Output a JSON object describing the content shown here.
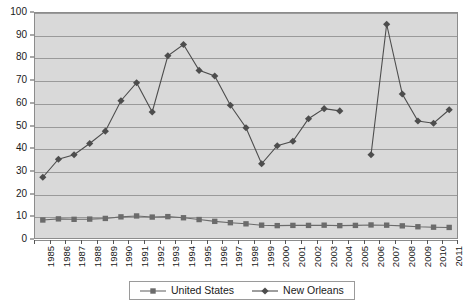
{
  "chart_data": {
    "type": "line",
    "title": "",
    "subtitle": "",
    "xlabel": "",
    "ylabel": "",
    "ylim": [
      0,
      100
    ],
    "yticks": [
      0,
      10,
      20,
      30,
      40,
      50,
      60,
      70,
      80,
      90,
      100
    ],
    "grid": true,
    "legend_position": "bottom",
    "categories": [
      "1985",
      "1986",
      "1987",
      "1988",
      "1989",
      "1990",
      "1991",
      "1992",
      "1993",
      "1994",
      "1995",
      "1996",
      "1997",
      "1998",
      "1999",
      "2000",
      "2001",
      "2002",
      "2003",
      "2004",
      "2005",
      "2006",
      "2007",
      "2008",
      "2009",
      "2010",
      "2011"
    ],
    "series": [
      {
        "name": "United States",
        "marker": "square",
        "color": "#6b6b6b",
        "values": [
          8,
          8.5,
          8.3,
          8.4,
          8.7,
          9.4,
          9.8,
          9.3,
          9.5,
          9,
          8.2,
          7.4,
          6.8,
          6.3,
          5.7,
          5.5,
          5.6,
          5.6,
          5.7,
          5.5,
          5.6,
          5.8,
          5.7,
          5.4,
          5,
          4.8,
          4.7
        ]
      },
      {
        "name": "New Orleans",
        "marker": "diamond",
        "color": "#4d4d4d",
        "values": [
          27,
          35,
          37,
          42,
          47.5,
          61,
          69,
          56,
          81,
          86,
          74.5,
          72,
          59,
          49,
          33,
          41,
          43,
          53,
          57.5,
          56.5,
          null,
          37,
          95,
          64,
          52,
          51,
          57
        ]
      }
    ]
  },
  "legend": {
    "entries": [
      {
        "label": "United States",
        "marker": "square"
      },
      {
        "label": "New Orleans",
        "marker": "diamond"
      }
    ]
  },
  "colors": {
    "plot_background": "#d9d9d9",
    "gridline": "#9a9a9a",
    "plot_border": "#8c8c8c",
    "united_states": "#6b6b6b",
    "new_orleans": "#4d4d4d",
    "text": "#1a1a1a"
  }
}
